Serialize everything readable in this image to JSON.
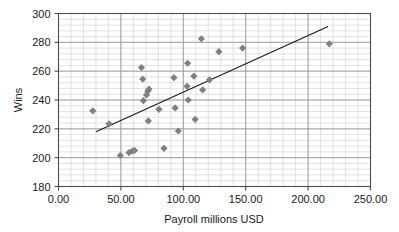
{
  "chart_data": {
    "type": "scatter",
    "title": "",
    "xlabel": "Payroll millions USD",
    "ylabel": "Wins",
    "xlim": [
      0,
      250
    ],
    "ylim": [
      180,
      300
    ],
    "xticks": [
      "0.00",
      "50.00",
      "100.00",
      "150.00",
      "200.00",
      "250.00"
    ],
    "xtick_values": [
      0,
      50,
      100,
      150,
      200,
      250
    ],
    "yticks": [
      "180",
      "200",
      "220",
      "240",
      "260",
      "280",
      "300"
    ],
    "ytick_values": [
      180,
      200,
      220,
      240,
      260,
      280,
      300
    ],
    "grid": true,
    "grid_minor_x_step": 10,
    "grid_minor_y_step": 4,
    "legend": "none",
    "marker": "diamond",
    "marker_color": "#808080",
    "points": [
      {
        "x": 27.5,
        "y": 232.5
      },
      {
        "x": 40.5,
        "y": 223.5
      },
      {
        "x": 49.5,
        "y": 201.5
      },
      {
        "x": 56.5,
        "y": 203.5
      },
      {
        "x": 59.0,
        "y": 204.5
      },
      {
        "x": 61.0,
        "y": 205.0
      },
      {
        "x": 66.5,
        "y": 262.5
      },
      {
        "x": 67.5,
        "y": 254.5
      },
      {
        "x": 68.0,
        "y": 239.5
      },
      {
        "x": 70.5,
        "y": 243.5
      },
      {
        "x": 71.5,
        "y": 246.0
      },
      {
        "x": 72.5,
        "y": 247.5
      },
      {
        "x": 72.0,
        "y": 225.5
      },
      {
        "x": 80.5,
        "y": 233.5
      },
      {
        "x": 84.5,
        "y": 206.5
      },
      {
        "x": 92.5,
        "y": 255.5
      },
      {
        "x": 93.5,
        "y": 234.5
      },
      {
        "x": 96.0,
        "y": 218.5
      },
      {
        "x": 103.5,
        "y": 265.5
      },
      {
        "x": 103.0,
        "y": 249.5
      },
      {
        "x": 104.0,
        "y": 240.0
      },
      {
        "x": 108.5,
        "y": 256.5
      },
      {
        "x": 109.5,
        "y": 226.5
      },
      {
        "x": 114.5,
        "y": 282.5
      },
      {
        "x": 115.5,
        "y": 247.0
      },
      {
        "x": 121.0,
        "y": 254.0
      },
      {
        "x": 128.5,
        "y": 273.5
      },
      {
        "x": 147.5,
        "y": 276.0
      },
      {
        "x": 217.0,
        "y": 279.0
      }
    ],
    "trendline": {
      "type": "linear",
      "x_start": 30.0,
      "y_start": 218.0,
      "x_end": 216.0,
      "y_end": 291.0,
      "color": "#1a1a1a"
    }
  }
}
